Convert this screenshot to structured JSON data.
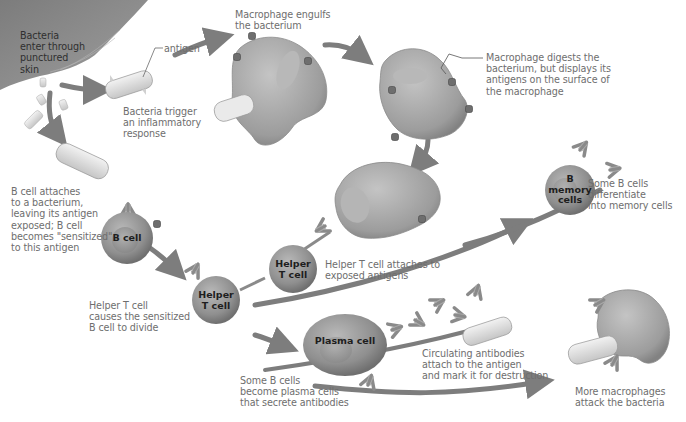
{
  "diagram": {
    "type": "immune-response-flow",
    "colors": {
      "skin": "#8a8a8a",
      "arrow": "#7d7d7d",
      "macrophage": "#a9a9a9",
      "cell_body": "#9a9a9a",
      "bacterium": "#e4e4e4",
      "antibody": "#8e8e8e",
      "text": "#6e6e6e",
      "cell_text": "#1e1e1e"
    },
    "labels": {
      "bacteria_enter": "Bacteria\nenter through\npunctured\nskin",
      "antigen": "antigen",
      "bacteria_trigger": "Bacteria trigger\nan inflammatory\nresponse",
      "macrophage_engulfs": "Macrophage engulfs\nthe bacterium",
      "macrophage_digests": "Macrophage digests the\nbacterium, but displays its\nantigens on the surface of\nthe macrophage",
      "b_cell_attaches": "B cell attaches\nto a bacterium,\nleaving its antigen\nexposed; B cell\nbecomes \"sensitized\"\nto this antigen",
      "helper_attaches": "Helper T cell attaches to\nexposed antigens",
      "helper_causes": "Helper T cell\ncauses the sensitized\nB cell to divide",
      "memory_differentiate": "Some B cells\ndifferentiate\ninto memory cells",
      "plasma_secrete": "Some B cells\nbecome plasma cells\nthat secrete antibodies",
      "circulating_antibodies": "Circulating antibodies\nattach to the antigen\nand mark it for destruction",
      "more_macrophages": "More macrophages\nattack the bacteria"
    },
    "cells": {
      "b_cell": "B cell",
      "helper_t_cell_upper": "Helper\nT cell",
      "helper_t_cell_lower": "Helper\nT cell",
      "b_memory_cells": "B\nmemory\ncells",
      "plasma_cell": "Plasma cell"
    }
  }
}
